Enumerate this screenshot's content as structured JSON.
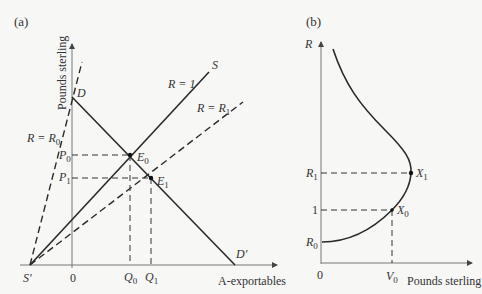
{
  "panel_a": {
    "tag": "(a)",
    "y_axis_label": "Pounds sterling",
    "x_axis_label": "A-exportables",
    "origin": "0",
    "points": {
      "D": "D",
      "D_prime": "D′",
      "S": "S",
      "S_prime": "S′",
      "E0": "E",
      "E0_sub": "0",
      "E1": "E",
      "E1_sub": "1"
    },
    "lines": {
      "r_equals_1": "R = 1",
      "r_equals_r0": "R = R",
      "r_equals_r0_sub": "0",
      "r_equals_r1": "R = R",
      "r_equals_r1_sub": "1"
    },
    "ticks": {
      "P0": "P",
      "P0_sub": "0",
      "P1": "P",
      "P1_sub": "1",
      "Q0": "Q",
      "Q0_sub": "0",
      "Q1": "Q",
      "Q1_sub": "1"
    }
  },
  "panel_b": {
    "tag": "(b)",
    "y_axis_label": "R",
    "x_axis_label": "Pounds sterling",
    "origin": "0",
    "ticks": {
      "R1": "R",
      "R1_sub": "1",
      "one": "1",
      "R0": "R",
      "R0_sub": "0",
      "V0": "V",
      "V0_sub": "0"
    },
    "points": {
      "X1": "X",
      "X1_sub": "1",
      "X0": "X",
      "X0_sub": "0"
    }
  },
  "colors": {
    "line": "#2a2a2a",
    "axis": "#777777",
    "background": "#f7f7f6"
  }
}
